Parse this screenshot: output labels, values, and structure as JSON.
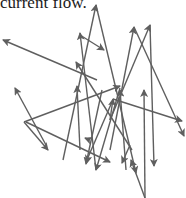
{
  "document": {
    "caption_text": "current flow."
  },
  "diagram": {
    "stroke_color": "#5f5f5f",
    "arrows": [
      {
        "from": [
          97,
          80
        ],
        "to": [
          3,
          40
        ]
      },
      {
        "from": [
          132,
          150
        ],
        "to": [
          76,
          62
        ]
      },
      {
        "from": [
          63,
          160
        ],
        "to": [
          96,
          5
        ]
      },
      {
        "from": [
          80,
          150
        ],
        "to": [
          77,
          86
        ]
      },
      {
        "from": [
          96,
          170
        ],
        "to": [
          80,
          33
        ]
      },
      {
        "from": [
          46,
          145
        ],
        "to": [
          15,
          88
        ]
      },
      {
        "from": [
          80,
          35
        ],
        "to": [
          104,
          50
        ]
      },
      {
        "from": [
          24,
          122
        ],
        "to": [
          120,
          86
        ]
      },
      {
        "from": [
          110,
          150
        ],
        "to": [
          134,
          27
        ]
      },
      {
        "from": [
          134,
          27
        ],
        "to": [
          184,
          136
        ]
      },
      {
        "from": [
          120,
          88
        ],
        "to": [
          96,
          170
        ]
      },
      {
        "from": [
          126,
          170
        ],
        "to": [
          120,
          90
        ]
      },
      {
        "from": [
          24,
          122
        ],
        "to": [
          48,
          150
        ]
      },
      {
        "from": [
          110,
          120
        ],
        "to": [
          150,
          25
        ]
      },
      {
        "from": [
          150,
          25
        ],
        "to": [
          154,
          166
        ]
      },
      {
        "from": [
          96,
          5
        ],
        "to": [
          136,
          173
        ]
      },
      {
        "from": [
          26,
          122
        ],
        "to": [
          110,
          162
        ]
      },
      {
        "from": [
          112,
          102
        ],
        "to": [
          86,
          162
        ]
      },
      {
        "from": [
          90,
          140
        ],
        "to": [
          85,
          138
        ]
      },
      {
        "from": [
          110,
          120
        ],
        "to": [
          113,
          99
        ]
      },
      {
        "from": [
          113,
          99
        ],
        "to": [
          182,
          121
        ]
      },
      {
        "from": [
          145,
          198
        ],
        "to": [
          131,
          160
        ]
      },
      {
        "from": [
          145,
          198
        ],
        "to": [
          144,
          90
        ]
      },
      {
        "from": [
          130,
          145
        ],
        "to": [
          122,
          163
        ]
      },
      {
        "from": [
          102,
          90
        ],
        "to": [
          86,
          164
        ]
      }
    ]
  }
}
